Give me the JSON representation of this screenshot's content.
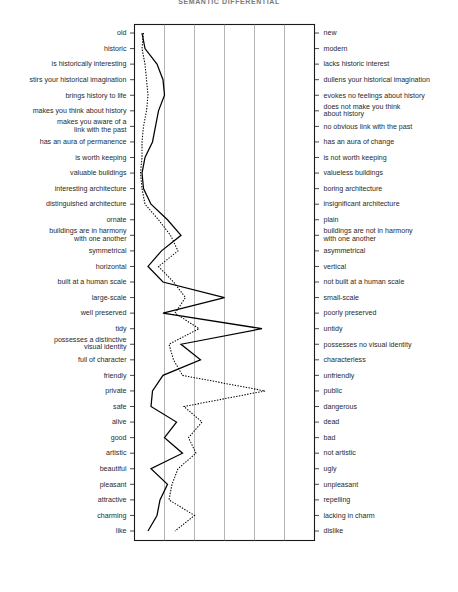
{
  "title": "SEMANTIC DIFFERENTIAL",
  "legend": {
    "items": [
      {
        "label": "The Shambles, York",
        "style": "solid",
        "color": "#000000"
      },
      {
        "label": "Bootham Bar, York",
        "style": "dotted",
        "color": "#000000"
      }
    ]
  },
  "chart_data": {
    "type": "line",
    "orientation": "vertical-semantic-differential",
    "title": "SEMANTIC DIFFERENTIAL",
    "xlabel": "",
    "ylabel": "",
    "xlim": [
      1,
      7
    ],
    "grid": true,
    "legend_position": "bottom",
    "scale_points": 7,
    "categories": [
      "old / new",
      "historic / modern",
      "is historically interesting / lacks historic interest",
      "stirs your historical imagination / dullens your historical imagination",
      "brings history to life / evokes no feelings about history",
      "makes you think about history / does not make you think about history",
      "makes you aware of a link with the past / no obvious link with the past",
      "has an aura of permanence / has an aura of change",
      "is worth keeping / is not worth keeping",
      "valuable buildings / valueless buildings",
      "interesting architecture / boring architecture",
      "distinguished architecture / insignificant architecture",
      "ornate / plain",
      "buildings are in harmony with one another / buildings are not in harmony with one another",
      "symmetrical / asymmetrical",
      "horizontal / vertical",
      "built at a human scale / not built at a human scale",
      "large-scale / small-scale",
      "well preserved / poorly preserved",
      "tidy / untidy",
      "possesses a distinctive visual identity / possesses no visual identity",
      "full of character / characterless",
      "friendly / unfriendly",
      "private / public",
      "safe / dangerous",
      "alive / dead",
      "good / bad",
      "artistic / not artistic",
      "beautiful / ugly",
      "pleasant / unpleasant",
      "attractive / repelling",
      "charming / lacking in charm",
      "like / dislike"
    ],
    "left_labels": [
      [
        "old"
      ],
      [
        "historic"
      ],
      [
        "is historically interesting"
      ],
      [
        "stirs your historical imagination"
      ],
      [
        "brings history to life"
      ],
      [
        "makes you think about history"
      ],
      [
        "makes you aware of a",
        "link with the past"
      ],
      [
        "has an aura of permanence"
      ],
      [
        "is worth keeping"
      ],
      [
        "valuable buildings"
      ],
      [
        "interesting architecture"
      ],
      [
        "distinguished architecture"
      ],
      [
        "ornate"
      ],
      [
        "buildings are in harmony",
        "with one another"
      ],
      [
        "symmetrical"
      ],
      [
        "horizontal"
      ],
      [
        "built at a human scale"
      ],
      [
        "large-scale"
      ],
      [
        "well preserved"
      ],
      [
        "tidy"
      ],
      [
        "possesses a distinctive",
        "visual identity"
      ],
      [
        "full of character"
      ],
      [
        "friendly"
      ],
      [
        "private"
      ],
      [
        "safe"
      ],
      [
        "alive"
      ],
      [
        "good"
      ],
      [
        "artistic"
      ],
      [
        "beautiful"
      ],
      [
        "pleasant"
      ],
      [
        "attractive"
      ],
      [
        "charming"
      ],
      [
        "like"
      ]
    ],
    "right_labels": [
      [
        "new"
      ],
      [
        "modern"
      ],
      [
        "lacks historic interest"
      ],
      [
        "dullens your historical imagination"
      ],
      [
        "evokes no feelings about history"
      ],
      [
        "does not make you think",
        "about history"
      ],
      [
        "no obvious link with the past"
      ],
      [
        "has an aura of change"
      ],
      [
        "is not worth keeping"
      ],
      [
        "valueless buildings"
      ],
      [
        "boring architecture"
      ],
      [
        "insignificant architecture"
      ],
      [
        "plain"
      ],
      [
        "buildings are not in harmony",
        "with one another"
      ],
      [
        "asymmetrical"
      ],
      [
        "vertical"
      ],
      [
        "not built at a human scale"
      ],
      [
        "small-scale"
      ],
      [
        "poorly preserved"
      ],
      [
        "untidy"
      ],
      [
        "possesses no visual identity"
      ],
      [
        "characterless"
      ],
      [
        "unfriendly"
      ],
      [
        "public"
      ],
      [
        "dangerous"
      ],
      [
        "dead"
      ],
      [
        "bad"
      ],
      [
        "not artistic"
      ],
      [
        "ugly"
      ],
      [
        "unpleasant"
      ],
      [
        "repelling"
      ],
      [
        "lacking in charm"
      ],
      [
        "dislike"
      ]
    ],
    "series": [
      {
        "name": "The Shambles, York",
        "style": "solid",
        "values": [
          1.25,
          1.35,
          1.75,
          1.95,
          2.0,
          1.8,
          1.7,
          1.6,
          1.35,
          1.25,
          1.3,
          1.55,
          2.1,
          2.55,
          1.9,
          1.45,
          1.95,
          4.0,
          1.95,
          5.25,
          2.55,
          3.2,
          1.95,
          1.6,
          1.55,
          2.4,
          2.0,
          2.6,
          1.55,
          2.1,
          1.85,
          1.75,
          1.45
        ]
      },
      {
        "name": "Bootham Bar, York",
        "style": "dotted",
        "values": [
          1.3,
          1.25,
          1.35,
          1.4,
          1.45,
          1.4,
          1.3,
          1.25,
          1.25,
          1.2,
          1.25,
          1.35,
          1.8,
          2.2,
          2.45,
          1.8,
          2.3,
          2.7,
          2.35,
          3.15,
          2.15,
          2.3,
          2.6,
          5.35,
          2.65,
          3.25,
          2.8,
          3.05,
          2.45,
          2.25,
          2.15,
          3.0,
          2.35
        ]
      }
    ]
  }
}
